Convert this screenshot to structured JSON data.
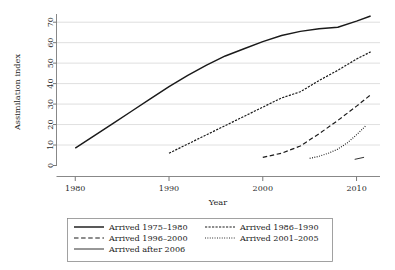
{
  "chart_data": {
    "type": "line",
    "title": "",
    "xlabel": "Year",
    "ylabel": "Assimilation index",
    "xlim": [
      1978,
      2012.5
    ],
    "ylim": [
      0,
      74
    ],
    "xticks": [
      1980,
      1990,
      2000,
      2010
    ],
    "xtick_labels": [
      "1980",
      "1990",
      "2000",
      "2010"
    ],
    "yticks": [
      0,
      10,
      20,
      30,
      40,
      50,
      60,
      70
    ],
    "ytick_labels": [
      "0",
      "10",
      "20",
      "30",
      "40",
      "50",
      "60",
      "70"
    ],
    "grid": "horizontal",
    "legend_position": "below-axes",
    "series": [
      {
        "name": "Arrived 1975–1980",
        "style": "solid",
        "x": [
          1980,
          1982,
          1984,
          1986,
          1988,
          1990,
          1992,
          1994,
          1996,
          1998,
          2000,
          2002,
          2004,
          2006,
          2008,
          2010,
          2011.5
        ],
        "values": [
          8.5,
          14.5,
          20.5,
          26.5,
          32.5,
          38.5,
          44.0,
          49.0,
          53.5,
          57.0,
          60.5,
          63.5,
          65.5,
          66.8,
          67.5,
          70.5,
          73.0
        ]
      },
      {
        "name": "Arrived 1986–1990",
        "style": "dashed-fine",
        "x": [
          1990,
          1992,
          1994,
          1996,
          1998,
          2000,
          2002,
          2004,
          2006,
          2008,
          2010,
          2011.5
        ],
        "values": [
          6.0,
          10.5,
          15.0,
          19.5,
          24.0,
          28.5,
          33.0,
          36.0,
          41.5,
          46.5,
          52.0,
          55.5
        ]
      },
      {
        "name": "Arrived 1996–2000",
        "style": "dashed",
        "x": [
          2000,
          2002,
          2004,
          2006,
          2008,
          2010,
          2011.5
        ],
        "values": [
          4.0,
          6.0,
          9.5,
          15.5,
          22.0,
          29.0,
          34.5
        ]
      },
      {
        "name": "Arrived 2001–2005",
        "style": "dotted",
        "x": [
          2005,
          2006,
          2007,
          2008,
          2009,
          2010,
          2011
        ],
        "values": [
          3.5,
          4.5,
          6.0,
          8.0,
          11.0,
          15.0,
          19.5
        ]
      },
      {
        "name": "Arrived after 2006",
        "style": "solid-thin",
        "x": [
          2009.8,
          2010.8
        ],
        "values": [
          3.0,
          4.0
        ]
      }
    ]
  },
  "legend": {
    "entries": [
      {
        "label": "Arrived 1975–1980",
        "style": "solid",
        "col": 0,
        "row": 0
      },
      {
        "label": "Arrived 1986–1990",
        "style": "dashed-fine",
        "col": 1,
        "row": 0
      },
      {
        "label": "Arrived 1996–2000",
        "style": "dashed",
        "col": 0,
        "row": 1
      },
      {
        "label": "Arrived 2001–2005",
        "style": "dotted",
        "col": 1,
        "row": 1
      },
      {
        "label": "Arrived after 2006",
        "style": "solid-thin",
        "col": 0,
        "row": 2
      }
    ]
  },
  "colors": {
    "line": "#1a1a1a",
    "grid": "#c9c9c9",
    "axis": "#7a7a7a",
    "background": "#ffffff"
  }
}
